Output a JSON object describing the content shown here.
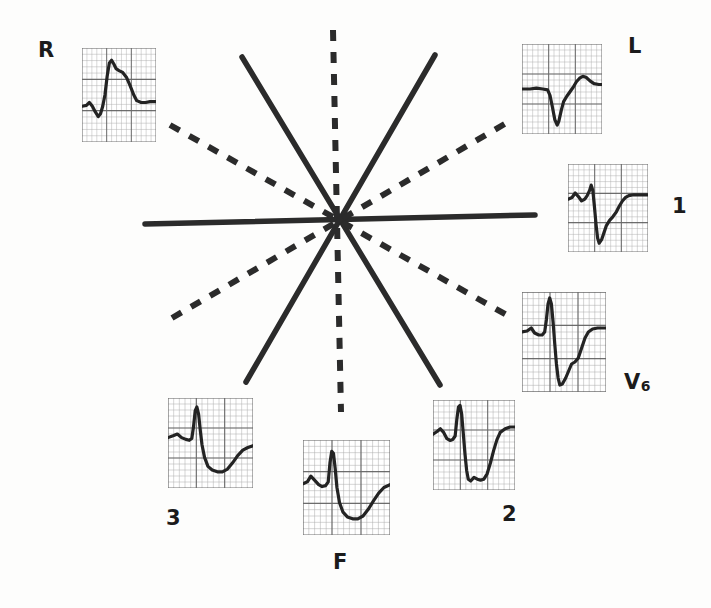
{
  "figure": {
    "type": "hexaxial-reference-system-with-ecg-complexes",
    "background_color": "#fdfdfc",
    "ink_color": "#2b2b2b",
    "grid_color": "#8d8d8d",
    "trace_color": "#232323"
  },
  "axes": {
    "center": {
      "x": 338,
      "y": 220
    },
    "solid_label": "bipolar limb lead axis",
    "dashed_label": "augmented unipolar lead axis",
    "lines": [
      {
        "name": "lead-1-axis",
        "style": "solid",
        "x1": 145,
        "y1": 224,
        "x2": 535,
        "y2": 215
      },
      {
        "name": "lead-2-axis",
        "style": "solid",
        "x1": 242,
        "y1": 57,
        "x2": 440,
        "y2": 385
      },
      {
        "name": "lead-3-axis",
        "style": "solid",
        "x1": 435,
        "y1": 55,
        "x2": 246,
        "y2": 382
      },
      {
        "name": "avf-axis",
        "style": "dashed",
        "x1": 333,
        "y1": 30,
        "x2": 341,
        "y2": 412
      },
      {
        "name": "avr-axis",
        "style": "dashed",
        "x1": 170,
        "y1": 125,
        "x2": 512,
        "y2": 318
      },
      {
        "name": "avl-axis",
        "style": "dashed",
        "x1": 172,
        "y1": 318,
        "x2": 508,
        "y2": 122
      }
    ]
  },
  "leads": [
    {
      "id": "aVR",
      "label": "R",
      "label_x": 38,
      "label_y": 40,
      "panel_x": 82,
      "panel_y": 48,
      "panel_w": 74,
      "panel_h": 94,
      "baseline": 0.62,
      "description": "small initial wave, deep Q, tall R spike, descending ST-T",
      "points": "0,62 6,61 10,58 14,62 18,68 22,73 25,70 28,62 31,50 34,30 37,16 40,13 43,17 46,22 50,24 55,26 60,31 65,40 70,50 74,56 80,58 86,58 92,57 100,57"
    },
    {
      "id": "aVL",
      "label": "L",
      "label_x": 628,
      "label_y": 36,
      "panel_x": 522,
      "panel_y": 44,
      "panel_w": 80,
      "panel_h": 90,
      "baseline": 0.5,
      "description": "flat baseline, sharp deep QS, rounded positive T wave",
      "points": "0,50 10,50 18,49 26,50 32,51 35,57 38,70 41,84 44,90 46,86 49,74 52,64 56,58 60,53 64,48 68,42 72,38 76,36 80,37 85,41 90,44 96,45 100,45"
    },
    {
      "id": "I",
      "label": "1",
      "label_x": 672,
      "label_y": 196,
      "panel_x": 568,
      "panel_y": 164,
      "panel_w": 80,
      "panel_h": 88,
      "baseline": 0.4,
      "description": "small notched P, sharp deep S, gradual rise back to baseline",
      "points": "0,40 5,38 9,33 13,37 17,42 21,40 24,36 27,30 29,24 31,30 33,48 35,68 37,84 39,90 42,86 45,78 48,70 52,64 56,60 60,55 64,48 68,42 72,38 76,36 82,35 90,35 100,35"
    },
    {
      "id": "V6",
      "label": "V",
      "label_sub": "6",
      "label_x": 624,
      "label_y": 372,
      "panel_x": 522,
      "panel_y": 292,
      "panel_w": 84,
      "panel_h": 100,
      "baseline": 0.4,
      "description": "tall narrow R spike, very deep S, slow stepped recovery to baseline",
      "points": "0,40 6,39 11,36 15,41 20,43 24,43 27,40 29,28 31,12 33,6 35,12 37,30 39,52 41,72 43,86 45,93 48,92 52,86 56,78 59,72 63,70 67,66 71,56 75,46 79,40 84,37 90,36 95,36 100,36"
    },
    {
      "id": "II",
      "label": "2",
      "label_x": 502,
      "label_y": 504,
      "panel_x": 433,
      "panel_y": 400,
      "panel_w": 82,
      "panel_h": 90,
      "baseline": 0.38,
      "description": "notched P, tall narrow R, deep S, long flat ST then rising T",
      "points": "0,38 5,35 9,32 13,36 17,43 21,45 24,44 27,40 29,22 31,8 33,6 35,16 37,38 39,60 41,78 43,88 46,90 50,86 54,88 58,89 62,88 66,82 70,70 74,56 78,44 82,36 88,32 94,30 100,30"
    },
    {
      "id": "III",
      "label": "3",
      "label_x": 166,
      "label_y": 508,
      "panel_x": 168,
      "panel_y": 398,
      "panel_w": 85,
      "panel_h": 90,
      "baseline": 0.44,
      "description": "low P wave, tall narrow R, deep broad inverted T, late recovery",
      "points": "0,44 6,42 11,40 16,44 21,46 25,47 28,45 30,32 32,14 34,10 36,18 38,36 40,52 43,66 47,76 52,80 58,82 64,82 70,79 76,72 82,64 88,58 94,55 100,53"
    },
    {
      "id": "aVF",
      "label": "F",
      "label_x": 333,
      "label_y": 552,
      "panel_x": 303,
      "panel_y": 440,
      "panel_w": 87,
      "panel_h": 95,
      "baseline": 0.44,
      "description": "notched P, tall narrow R, deep broad inverted T, rising terminal segment",
      "points": "0,46 5,44 9,38 13,42 18,47 22,49 26,48 29,44 31,24 33,12 35,14 37,30 39,50 42,66 46,76 51,81 57,83 63,83 69,80 75,73 81,64 87,56 93,50 100,47"
    }
  ]
}
